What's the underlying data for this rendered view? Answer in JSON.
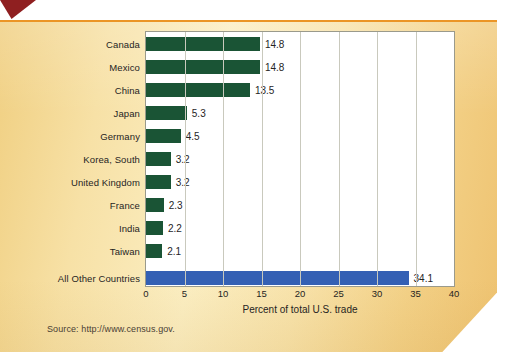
{
  "figure": {
    "source_note": "Source: http://www.census.gov.",
    "accent_rule_color": "#eb9526",
    "panel_color": "#f6e0a4",
    "arrow_color": "#8f1f20"
  },
  "chart_data": {
    "type": "bar",
    "orientation": "horizontal",
    "title": "",
    "xlabel": "Percent of total U.S. trade",
    "ylabel": "",
    "xlim": [
      0,
      40
    ],
    "ticks": [
      "0",
      "5",
      "10",
      "15",
      "20",
      "25",
      "30",
      "35",
      "40"
    ],
    "tick_values": [
      0,
      5,
      10,
      15,
      20,
      25,
      30,
      35,
      40
    ],
    "grid": "vertical",
    "legend": "none",
    "categories": [
      "Canada",
      "Mexico",
      "China",
      "Japan",
      "Germany",
      "Korea, South",
      "United Kingdom",
      "France",
      "India",
      "Taiwan",
      "All Other Countries"
    ],
    "values": [
      14.8,
      14.8,
      13.5,
      5.3,
      4.5,
      3.2,
      3.2,
      2.3,
      2.2,
      2.1,
      34.1
    ],
    "value_labels": [
      "14.8",
      "14.8",
      "13.5",
      "5.3",
      "4.5",
      "3.2",
      "3.2",
      "2.3",
      "2.2",
      "2.1",
      "34.1"
    ],
    "bar_colors": [
      "#1a5435",
      "#1a5435",
      "#1a5435",
      "#1a5435",
      "#1a5435",
      "#1a5435",
      "#1a5435",
      "#1a5435",
      "#1a5435",
      "#1a5435",
      "#3460b4"
    ]
  }
}
